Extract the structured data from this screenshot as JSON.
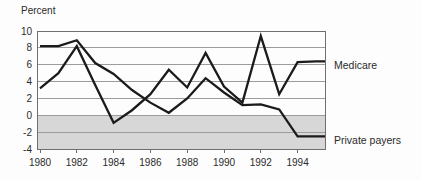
{
  "chart_data": {
    "type": "line",
    "title": "",
    "ylabel": "Percent",
    "xlabel": "",
    "xlim": [
      1980,
      1995.5
    ],
    "ylim": [
      -4,
      10
    ],
    "yticks": [
      10,
      8,
      6,
      4,
      2,
      0,
      -2,
      -4
    ],
    "xticks": [
      1980,
      1982,
      1984,
      1986,
      1988,
      1990,
      1992,
      1994
    ],
    "x": [
      1980,
      1981,
      1982,
      1983,
      1984,
      1985,
      1986,
      1987,
      1988,
      1989,
      1990,
      1991,
      1992,
      1993,
      1994,
      1995
    ],
    "series": [
      {
        "name": "Medicare",
        "values": [
          3.2,
          5.0,
          8.2,
          3.6,
          -0.9,
          0.6,
          2.5,
          5.4,
          3.3,
          7.4,
          3.4,
          1.5,
          9.4,
          2.5,
          6.3,
          6.4
        ]
      },
      {
        "name": "Private payers",
        "values": [
          8.2,
          8.2,
          8.9,
          6.2,
          4.9,
          3.0,
          1.5,
          0.3,
          2.0,
          4.4,
          2.7,
          1.2,
          1.3,
          0.7,
          -2.5,
          -2.5
        ]
      }
    ],
    "shaded_band": {
      "from": 0,
      "to": -4
    },
    "grid": "horizontal",
    "legend_position": "right-outside-line-end-labels",
    "colors": {
      "line": "#1b1b1b",
      "band": "#d7d7d7",
      "grid": "#9c9c9c",
      "frame": "#6f6f6f",
      "text": "#2b2b2b"
    }
  }
}
